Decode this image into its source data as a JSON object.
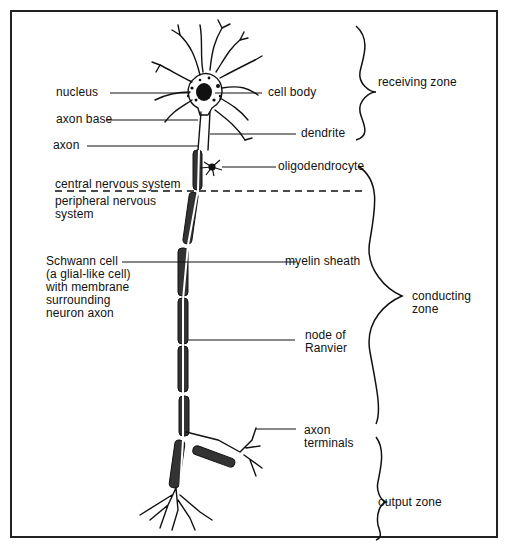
{
  "diagram": {
    "labels": {
      "nucleus": "nucleus",
      "cell_body": "cell body",
      "axon_base": "axon base",
      "dendrite": "dendrite",
      "axon": "axon",
      "oligodendrocyte": "oligodendrocyte",
      "cns": "central nervous system",
      "pns": "peripheral nervous\nsystem",
      "schwann": "Schwann cell\n(a glial-like cell)\nwith membrane\nsurrounding\nneuron axon",
      "myelin": "myelin sheath",
      "node": "node of\nRanvier",
      "terminals": "axon\nterminals"
    },
    "zones": {
      "receiving": "receiving zone",
      "conducting": "conducting\nzone",
      "output": "output zone"
    },
    "colors": {
      "ink": "#111111",
      "background": "#ffffff"
    }
  }
}
